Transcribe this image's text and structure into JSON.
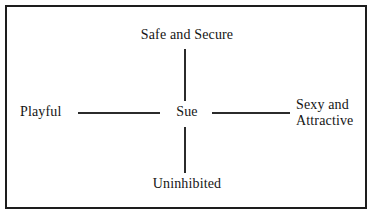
{
  "diagram": {
    "type": "radial-attribute-map",
    "frame": {
      "border_color": "#1d1d1d",
      "background_color": "#ffffff"
    },
    "stroke_color": "#2b2b2b",
    "text_color": "#151515",
    "center": {
      "label": "Sue"
    },
    "nodes": [
      {
        "position": "top",
        "label": "Safe and Secure"
      },
      {
        "position": "left",
        "label": "Playful"
      },
      {
        "position": "right",
        "label_line1": "Sexy and",
        "label_line2": "Attractive"
      },
      {
        "position": "bottom",
        "label": "Uninhibited"
      }
    ],
    "connectors": [
      {
        "name": "center-to-top",
        "orientation": "vertical"
      },
      {
        "name": "center-to-bottom",
        "orientation": "vertical"
      },
      {
        "name": "center-to-left",
        "orientation": "horizontal"
      },
      {
        "name": "center-to-right",
        "orientation": "horizontal"
      }
    ]
  }
}
